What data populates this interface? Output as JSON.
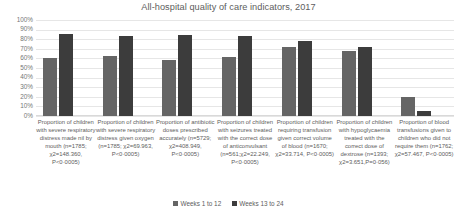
{
  "chart_data": {
    "type": "bar",
    "title": "All-hospital quality of care indicators, 2017",
    "xlabel": "",
    "ylabel": "",
    "ylim": [
      0,
      100
    ],
    "grid": true,
    "legend_position": "bottom",
    "ytick_labels": [
      "100%",
      "90%",
      "80%",
      "70%",
      "60%",
      "50%",
      "40%",
      "30%",
      "20%",
      "10%",
      "0%"
    ],
    "ytick_values": [
      100,
      90,
      80,
      70,
      60,
      50,
      40,
      30,
      20,
      10,
      0
    ],
    "categories": [
      "Proportion of children with severe respiratory distress made nil by mouth (n=1785; χ2=148.360, P<0·0005)",
      "Proportion of children with severe respiratory distress given oxygen (n=1785; χ2=69.963, P<0·0005)",
      "Proportion of antibiotic doses prescribed accurately (n=5729; χ2=408.949, P<0·0005)",
      "Proportion of children with seizures treated with the correct dose of anticonvulsant (n=561;χ2=22.249, P<0·0005)",
      "Proportion of children requiring transfusion given correct volume of blood (n=1670; χ2=33.714, P<0·0005)",
      "Proportion of children with hypoglycaemia treated with the correct dose of dextrose (n=1393; χ2=3.651,P=0·056)",
      "Proportion of blood transfusions given to children who did not require them (n=1762; χ2=57.467, P<0·0005)"
    ],
    "series": [
      {
        "name": "Weeks 1 to 12",
        "color": "#656565",
        "values": [
          60,
          62,
          58,
          61,
          72,
          68,
          20
        ]
      },
      {
        "name": "Weeks 13 to 24",
        "color": "#3c3c3c",
        "values": [
          85,
          83,
          84,
          83,
          78,
          72,
          5
        ]
      }
    ]
  }
}
